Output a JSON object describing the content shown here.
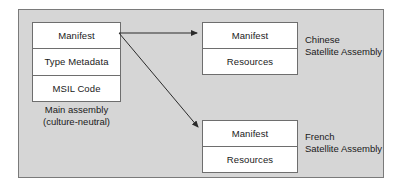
{
  "figure": {
    "background_color": "#d6d6d6",
    "frame_border_color": "#7a7a7a",
    "box_fill_color": "#ffffff",
    "box_border_color": "#6e6e6e",
    "arrow_color": "#2b2b2b",
    "text_color": "#1a1a1a"
  },
  "main_assembly": {
    "cells": [
      {
        "label": "Manifest"
      },
      {
        "label": "Type Metadata"
      },
      {
        "label": "MSIL Code"
      }
    ],
    "caption": {
      "line1": "Main assembly",
      "line2": "(culture-neutral)"
    }
  },
  "chinese_satellite": {
    "cells": [
      {
        "label": "Manifest"
      },
      {
        "label": "Resources"
      }
    ],
    "caption": {
      "line1": "Chinese",
      "line2": "Satellite Assembly"
    }
  },
  "french_satellite": {
    "cells": [
      {
        "label": "Manifest"
      },
      {
        "label": "Resources"
      }
    ],
    "caption": {
      "line1": "French",
      "line2": "Satellite Assembly"
    }
  },
  "arrows": [
    {
      "name": "manifest-to-chinese-satellite",
      "from": "main assembly manifest",
      "to": "Chinese Satellite Assembly",
      "x1": 119,
      "y1": 33,
      "x2": 197,
      "y2": 33
    },
    {
      "name": "manifest-to-french-satellite",
      "from": "main assembly manifest",
      "to": "French Satellite Assembly",
      "x1": 119,
      "y1": 33,
      "x2": 198,
      "y2": 127
    }
  ]
}
